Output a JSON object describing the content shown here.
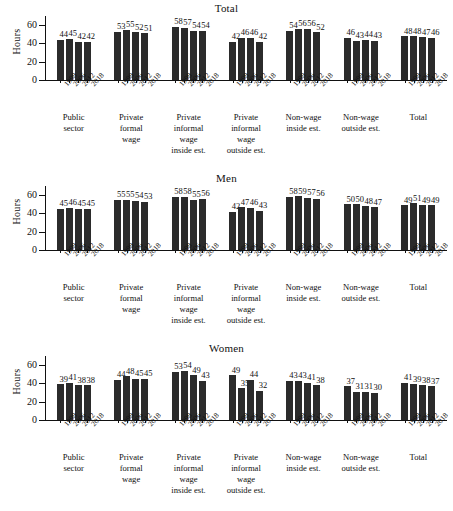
{
  "figure": {
    "ylabel": "Hours",
    "yticks": [
      0,
      20,
      40,
      60
    ],
    "ymax": 70,
    "years": [
      "1998",
      "2006",
      "2012",
      "2018"
    ],
    "categories": [
      [
        "Public",
        "sector"
      ],
      [
        "Private",
        "formal",
        "wage"
      ],
      [
        "Private",
        "informal",
        "wage",
        "inside est."
      ],
      [
        "Private",
        "informal",
        "wage",
        "outside est."
      ],
      [
        "Non-wage",
        "inside est."
      ],
      [
        "Non-wage",
        "outside est."
      ],
      [
        "Total"
      ]
    ],
    "bar_color": "#2b2b2b"
  },
  "chart_data": [
    {
      "type": "bar",
      "title": "Total",
      "xlabel": "",
      "ylabel": "Hours",
      "ylim": [
        0,
        70
      ],
      "yticks": [
        0,
        20,
        40,
        60
      ],
      "grid": false,
      "legend": "none",
      "categories": [
        "Public sector",
        "Private formal wage",
        "Private informal wage inside est.",
        "Private informal wage outside est.",
        "Non-wage inside est.",
        "Non-wage outside est.",
        "Total"
      ],
      "x": [
        "1998",
        "2006",
        "2012",
        "2018"
      ],
      "groups": [
        {
          "category": "Public sector",
          "values": [
            44,
            45,
            42,
            42
          ]
        },
        {
          "category": "Private formal wage",
          "values": [
            53,
            55,
            52,
            51
          ]
        },
        {
          "category": "Private informal wage inside est.",
          "values": [
            58,
            57,
            54,
            54
          ]
        },
        {
          "category": "Private informal wage outside est.",
          "values": [
            42,
            46,
            46,
            42
          ]
        },
        {
          "category": "Non-wage inside est.",
          "values": [
            54,
            56,
            56,
            52
          ]
        },
        {
          "category": "Non-wage outside est.",
          "values": [
            46,
            43,
            44,
            43
          ]
        },
        {
          "category": "Total",
          "values": [
            48,
            48,
            47,
            46
          ]
        }
      ]
    },
    {
      "type": "bar",
      "title": "Men",
      "xlabel": "",
      "ylabel": "Hours",
      "ylim": [
        0,
        70
      ],
      "yticks": [
        0,
        20,
        40,
        60
      ],
      "grid": false,
      "legend": "none",
      "categories": [
        "Public sector",
        "Private formal wage",
        "Private informal wage inside est.",
        "Private informal wage outside est.",
        "Non-wage inside est.",
        "Non-wage outside est.",
        "Total"
      ],
      "x": [
        "1998",
        "2006",
        "2012",
        "2018"
      ],
      "groups": [
        {
          "category": "Public sector",
          "values": [
            45,
            46,
            45,
            45
          ]
        },
        {
          "category": "Private formal wage",
          "values": [
            55,
            55,
            54,
            53
          ]
        },
        {
          "category": "Private informal wage inside est.",
          "values": [
            58,
            58,
            55,
            56
          ]
        },
        {
          "category": "Private informal wage outside est.",
          "values": [
            42,
            47,
            46,
            43
          ]
        },
        {
          "category": "Non-wage inside est.",
          "values": [
            58,
            59,
            57,
            56
          ]
        },
        {
          "category": "Non-wage outside est.",
          "values": [
            50,
            50,
            48,
            47
          ]
        },
        {
          "category": "Total",
          "values": [
            49,
            51,
            49,
            49
          ]
        }
      ]
    },
    {
      "type": "bar",
      "title": "Women",
      "xlabel": "",
      "ylabel": "Hours",
      "ylim": [
        0,
        70
      ],
      "yticks": [
        0,
        20,
        40,
        60
      ],
      "grid": false,
      "legend": "none",
      "categories": [
        "Public sector",
        "Private formal wage",
        "Private informal wage inside est.",
        "Private informal wage outside est.",
        "Non-wage inside est.",
        "Non-wage outside est.",
        "Total"
      ],
      "x": [
        "1998",
        "2006",
        "2012",
        "2018"
      ],
      "groups": [
        {
          "category": "Public sector",
          "values": [
            39,
            41,
            38,
            38
          ]
        },
        {
          "category": "Private formal wage",
          "values": [
            44,
            48,
            45,
            45
          ]
        },
        {
          "category": "Private informal wage inside est.",
          "values": [
            53,
            54,
            49,
            43
          ]
        },
        {
          "category": "Private informal wage outside est.",
          "values": [
            49,
            35,
            44,
            32
          ]
        },
        {
          "category": "Non-wage inside est.",
          "values": [
            43,
            43,
            41,
            38
          ]
        },
        {
          "category": "Non-wage outside est.",
          "values": [
            37,
            31,
            31,
            30
          ]
        },
        {
          "category": "Total",
          "values": [
            41,
            39,
            38,
            37
          ]
        }
      ]
    }
  ]
}
